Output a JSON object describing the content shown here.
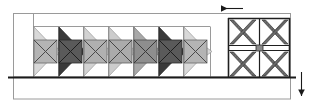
{
  "figure": {
    "name": "structural-frame-diagram",
    "type": "engineering-elevation-diagram",
    "width": 312,
    "height": 104,
    "background": "#ffffff"
  },
  "colors": {
    "outline": "#8a8a8a",
    "outline_dark": "#222222",
    "baseline": "#1a1a1a",
    "hatch_dark": "#4a4a4a",
    "fill_light": "#d8d8d8",
    "fill_medium": "#a8a8a8",
    "fill_dark": "#585858",
    "fill_very_dark": "#3a3a3a",
    "fill_white": "#ffffff",
    "arrow": "#1a1a1a"
  },
  "outer_frame": {
    "label": "outer-frame-rectangle",
    "x": 13,
    "y": 13,
    "width": 277,
    "height": 64,
    "stroke": "#9a9a9a",
    "stroke_width": 1
  },
  "lower_frame": {
    "label": "lower-base-rectangle",
    "x": 13,
    "y": 77,
    "width": 277,
    "height": 22,
    "stroke": "#9a9a9a",
    "stroke_width": 1
  },
  "baseline": {
    "label": "ground-baseline",
    "x1": 8,
    "y1": 77,
    "x2": 296,
    "y2": 77,
    "stroke": "#1a1a1a",
    "stroke_width": 2
  },
  "inner_top_rail": {
    "label": "upper-rail-line",
    "x1": 33,
    "y1": 26,
    "x2": 210,
    "y2": 26,
    "stroke": "#9a9a9a",
    "stroke_width": 1
  },
  "left_bay": {
    "label": "left-vertical-divider",
    "x": 33,
    "y_top": 13,
    "y_bottom": 77
  },
  "module_row": {
    "label": "repeating-wedge-module-row",
    "count": 7,
    "start_x": 33,
    "pitch": 25,
    "module_width": 25,
    "top_y": 26,
    "bottom_y": 77,
    "shades": [
      "light",
      "very_dark",
      "light",
      "light",
      "medium",
      "very_dark",
      "light"
    ],
    "modules": [
      {
        "index": 1,
        "shade": "light",
        "fill": "#d8d8d8",
        "x": 33
      },
      {
        "index": 2,
        "shade": "very_dark",
        "fill": "#3a3a3a",
        "x": 58
      },
      {
        "index": 3,
        "shade": "light",
        "fill": "#d2d2d2",
        "x": 83
      },
      {
        "index": 4,
        "shade": "light",
        "fill": "#cccccc",
        "x": 108
      },
      {
        "index": 5,
        "shade": "medium",
        "fill": "#a8a8a8",
        "x": 133
      },
      {
        "index": 6,
        "shade": "very_dark",
        "fill": "#3a3a3a",
        "x": 158
      },
      {
        "index": 7,
        "shade": "light",
        "fill": "#d8d8d8",
        "x": 183
      }
    ]
  },
  "right_panel": {
    "label": "cross-braced-panel",
    "x": 228,
    "y": 18,
    "width": 62,
    "height": 59,
    "rows": 2,
    "cols": 2,
    "brace_type": "x-brace",
    "brace_fill": "#6a6a6a",
    "center_block": true,
    "center_block_fill": "#8a8a8a"
  },
  "arrows": [
    {
      "name": "load-arrow-horizontal",
      "direction": "left",
      "x_tail": 243,
      "x_head": 219,
      "y": 8,
      "stroke": "#1a1a1a"
    },
    {
      "name": "load-arrow-vertical",
      "direction": "down",
      "x": 301,
      "y_tail": 72,
      "y_head": 98,
      "stroke": "#1a1a1a"
    }
  ]
}
